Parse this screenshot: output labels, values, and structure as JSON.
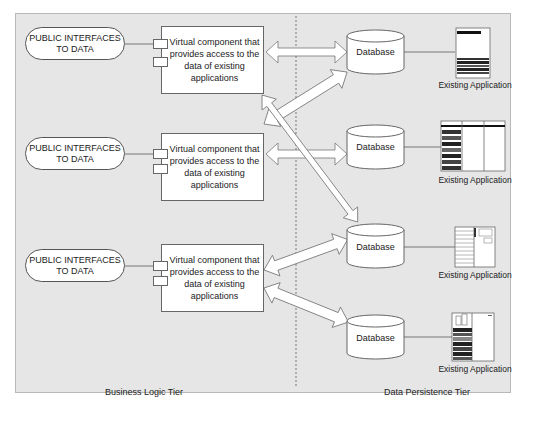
{
  "diagram": {
    "tiers": {
      "left_label": "Business Logic Tier",
      "right_label": "Data Persistence Tier"
    },
    "interfaces": [
      {
        "line1": "PUBLIC INTERFACES",
        "line2": "TO DATA"
      },
      {
        "line1": "PUBLIC INTERFACES",
        "line2": "TO DATA"
      },
      {
        "line1": "PUBLIC INTERFACES",
        "line2": "TO DATA"
      }
    ],
    "components": [
      {
        "text": "Virtual component that provides access to the data of existing applications"
      },
      {
        "text": "Virtual component that provides access to the data of existing applications"
      },
      {
        "text": "Virtual component that provides access to the data of existing applications"
      }
    ],
    "databases": [
      {
        "label": "Database"
      },
      {
        "label": "Database"
      },
      {
        "label": "Database"
      },
      {
        "label": "Database"
      }
    ],
    "applications": [
      {
        "label": "Existing Application",
        "icon": "app-window-list-icon"
      },
      {
        "label": "Existing Application",
        "icon": "app-window-columns-icon"
      },
      {
        "label": "Existing Application",
        "icon": "app-window-form-icon"
      },
      {
        "label": "Existing Application",
        "icon": "app-window-sidebar-icon"
      }
    ],
    "connections": [
      {
        "from": "component-1",
        "to": "database-1",
        "type": "bidirectional"
      },
      {
        "from": "component-1",
        "to": "database-3",
        "type": "bidirectional"
      },
      {
        "from": "component-2",
        "to": "database-1",
        "type": "bidirectional"
      },
      {
        "from": "component-2",
        "to": "database-2",
        "type": "bidirectional"
      },
      {
        "from": "component-3",
        "to": "database-3",
        "type": "bidirectional"
      },
      {
        "from": "component-3",
        "to": "database-4",
        "type": "bidirectional"
      }
    ],
    "colors": {
      "panel": "#e6e6e6",
      "border": "#555555",
      "fill": "#ffffff"
    }
  }
}
